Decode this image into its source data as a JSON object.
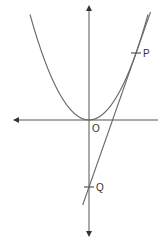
{
  "diagram": {
    "type": "parabola-with-tangent",
    "colors": {
      "background": "#ffffff",
      "axis": "#555555",
      "curve": "#6a6a6a",
      "tangent": "#6a6a6a",
      "label": "#333333"
    },
    "labels": {
      "origin": "O",
      "point_p": "P",
      "point_q": "Q"
    },
    "points": {
      "O": {
        "x": 89,
        "y": 120
      },
      "P": {
        "x": 136,
        "y": 53
      },
      "Q": {
        "x": 89,
        "y": 187
      }
    }
  }
}
